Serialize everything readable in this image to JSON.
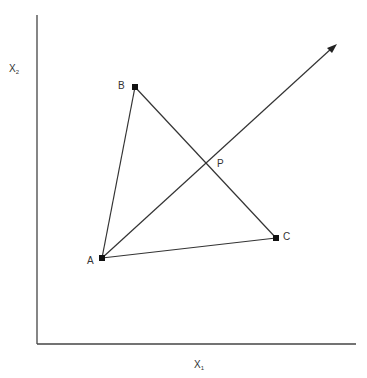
{
  "diagram": {
    "axes": {
      "x_label": "X",
      "x_subscript": "1",
      "y_label": "X",
      "y_subscript": "2",
      "color": "#444444"
    },
    "points": [
      {
        "id": "A",
        "label": "A",
        "x": 102,
        "y": 258
      },
      {
        "id": "B",
        "label": "B",
        "x": 135,
        "y": 87
      },
      {
        "id": "C",
        "label": "C",
        "x": 276,
        "y": 238
      }
    ],
    "intersection": {
      "label": "P",
      "x": 207,
      "y": 164
    },
    "arrow": {
      "from": "A",
      "to_x": 336,
      "to_y": 45
    },
    "line_color": "#333333"
  }
}
